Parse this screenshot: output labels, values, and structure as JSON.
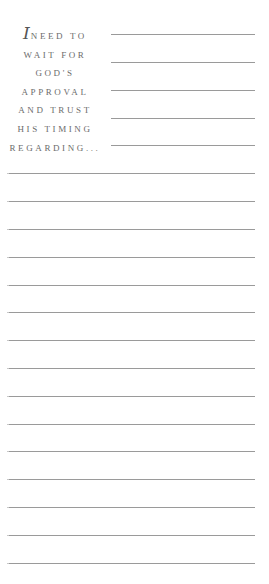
{
  "prompt": {
    "drop_cap": "I",
    "lines": [
      "NEED TO",
      "WAIT FOR",
      "GOD'S",
      "APPROVAL",
      "AND TRUST",
      "HIS TIMING",
      "REGARDING..."
    ]
  },
  "writing_lines": {
    "short_count": 5,
    "full_count": 15
  },
  "colors": {
    "text": "#6b6b6b",
    "rule": "#9a9a9a",
    "background": "#ffffff"
  }
}
